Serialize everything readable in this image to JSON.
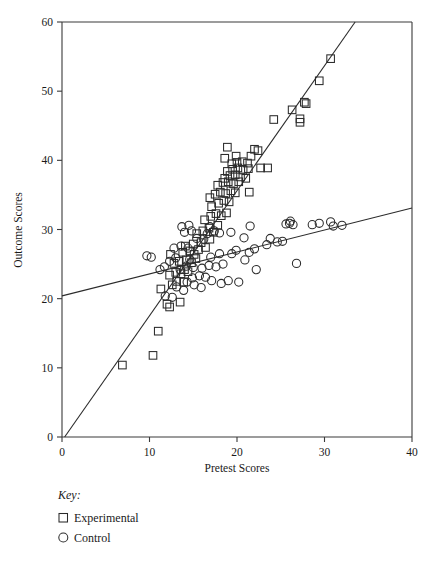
{
  "chart_data": {
    "type": "scatter",
    "title": "",
    "xlabel": "Pretest Scores",
    "ylabel": "Outcome Scores",
    "xlim": [
      0,
      40
    ],
    "ylim": [
      0,
      60
    ],
    "xticks": [
      0,
      10,
      20,
      30,
      40
    ],
    "yticks": [
      0,
      10,
      20,
      30,
      40,
      50,
      60
    ],
    "grid": false,
    "legend_position": "below-axes-left",
    "legend_title": "Key:",
    "series": [
      {
        "name": "Experimental",
        "marker": "square",
        "points": [
          [
            6.9,
            10.4
          ],
          [
            10.4,
            11.8
          ],
          [
            11.0,
            15.3
          ],
          [
            12.3,
            18.8
          ],
          [
            12.0,
            19.2
          ],
          [
            13.5,
            19.5
          ],
          [
            11.3,
            21.4
          ],
          [
            12.6,
            22.0
          ],
          [
            13.1,
            22.5
          ],
          [
            13.9,
            22.4
          ],
          [
            12.3,
            23.4
          ],
          [
            13.0,
            23.8
          ],
          [
            13.6,
            23.6
          ],
          [
            14.0,
            24.2
          ],
          [
            14.4,
            23.9
          ],
          [
            12.8,
            25.1
          ],
          [
            13.4,
            25.4
          ],
          [
            14.2,
            25.6
          ],
          [
            14.8,
            25.2
          ],
          [
            15.3,
            25.8
          ],
          [
            12.4,
            26.4
          ],
          [
            13.8,
            26.7
          ],
          [
            14.6,
            26.9
          ],
          [
            15.1,
            26.4
          ],
          [
            15.6,
            27.1
          ],
          [
            14.1,
            27.6
          ],
          [
            15.0,
            27.9
          ],
          [
            15.9,
            28.1
          ],
          [
            16.4,
            27.4
          ],
          [
            16.9,
            28.6
          ],
          [
            15.4,
            29.4
          ],
          [
            16.1,
            29.8
          ],
          [
            16.8,
            30.2
          ],
          [
            17.3,
            29.6
          ],
          [
            17.8,
            30.6
          ],
          [
            16.3,
            31.4
          ],
          [
            17.0,
            31.9
          ],
          [
            17.6,
            32.3
          ],
          [
            18.2,
            32.0
          ],
          [
            18.8,
            32.4
          ],
          [
            17.1,
            33.3
          ],
          [
            17.9,
            33.8
          ],
          [
            18.5,
            34.2
          ],
          [
            19.1,
            34.0
          ],
          [
            16.9,
            34.6
          ],
          [
            17.5,
            35.1
          ],
          [
            18.1,
            35.4
          ],
          [
            18.7,
            35.2
          ],
          [
            19.3,
            35.6
          ],
          [
            19.8,
            35.3
          ],
          [
            21.4,
            35.4
          ],
          [
            17.8,
            36.4
          ],
          [
            18.4,
            36.8
          ],
          [
            19.0,
            36.9
          ],
          [
            19.6,
            36.6
          ],
          [
            20.2,
            36.9
          ],
          [
            18.6,
            37.4
          ],
          [
            19.2,
            37.8
          ],
          [
            19.8,
            37.9
          ],
          [
            20.4,
            37.6
          ],
          [
            21.0,
            37.4
          ],
          [
            18.9,
            38.4
          ],
          [
            19.5,
            38.7
          ],
          [
            20.1,
            38.9
          ],
          [
            20.7,
            38.6
          ],
          [
            21.3,
            38.8
          ],
          [
            22.7,
            38.9
          ],
          [
            23.5,
            38.9
          ],
          [
            19.4,
            39.5
          ],
          [
            20.0,
            39.7
          ],
          [
            20.6,
            39.8
          ],
          [
            21.2,
            39.6
          ],
          [
            18.6,
            40.3
          ],
          [
            19.9,
            40.6
          ],
          [
            21.6,
            40.6
          ],
          [
            22.4,
            41.4
          ],
          [
            18.9,
            41.9
          ],
          [
            22.0,
            41.6
          ],
          [
            24.2,
            45.9
          ],
          [
            26.3,
            47.3
          ],
          [
            27.2,
            45.5
          ],
          [
            27.2,
            46.0
          ],
          [
            27.7,
            48.4
          ],
          [
            27.9,
            48.2
          ],
          [
            29.4,
            51.5
          ],
          [
            30.7,
            54.7
          ]
        ]
      },
      {
        "name": "Control",
        "marker": "circle",
        "points": [
          [
            11.8,
            20.4
          ],
          [
            12.6,
            20.2
          ],
          [
            13.9,
            21.2
          ],
          [
            13.1,
            21.7
          ],
          [
            14.3,
            22.4
          ],
          [
            15.1,
            22.0
          ],
          [
            15.9,
            21.6
          ],
          [
            14.9,
            23.0
          ],
          [
            15.7,
            23.3
          ],
          [
            16.4,
            23.1
          ],
          [
            17.1,
            22.6
          ],
          [
            18.2,
            22.2
          ],
          [
            19.0,
            22.6
          ],
          [
            20.2,
            22.4
          ],
          [
            11.2,
            24.2
          ],
          [
            11.7,
            24.6
          ],
          [
            13.5,
            24.2
          ],
          [
            14.2,
            24.7
          ],
          [
            15.0,
            24.5
          ],
          [
            16.0,
            24.4
          ],
          [
            16.8,
            24.8
          ],
          [
            17.6,
            24.6
          ],
          [
            18.4,
            25.0
          ],
          [
            20.9,
            25.6
          ],
          [
            22.2,
            24.2
          ],
          [
            26.8,
            25.1
          ],
          [
            9.7,
            26.2
          ],
          [
            10.2,
            26.0
          ],
          [
            12.3,
            25.4
          ],
          [
            13.0,
            25.9
          ],
          [
            14.6,
            25.7
          ],
          [
            17.0,
            26.0
          ],
          [
            18.0,
            26.5
          ],
          [
            19.4,
            26.5
          ],
          [
            21.4,
            26.7
          ],
          [
            12.8,
            27.3
          ],
          [
            13.6,
            27.6
          ],
          [
            14.4,
            27.3
          ],
          [
            19.9,
            27.0
          ],
          [
            22.0,
            27.2
          ],
          [
            23.4,
            27.8
          ],
          [
            24.6,
            28.2
          ],
          [
            15.4,
            28.7
          ],
          [
            16.2,
            28.6
          ],
          [
            20.8,
            28.8
          ],
          [
            23.8,
            28.7
          ],
          [
            25.2,
            28.3
          ],
          [
            14.0,
            29.6
          ],
          [
            14.8,
            29.8
          ],
          [
            16.6,
            29.4
          ],
          [
            17.4,
            29.8
          ],
          [
            18.0,
            29.5
          ],
          [
            19.3,
            29.6
          ],
          [
            13.7,
            30.4
          ],
          [
            14.5,
            30.6
          ],
          [
            16.9,
            30.4
          ],
          [
            21.5,
            30.5
          ],
          [
            25.6,
            30.8
          ],
          [
            26.0,
            30.9
          ],
          [
            26.4,
            30.7
          ],
          [
            26.1,
            31.2
          ],
          [
            28.6,
            30.7
          ],
          [
            29.4,
            30.9
          ],
          [
            30.7,
            31.1
          ],
          [
            31.0,
            30.5
          ],
          [
            32.0,
            30.6
          ]
        ]
      }
    ],
    "fit_lines": [
      {
        "series": "Experimental",
        "x0": 0.3,
        "y0": 0.0,
        "x1": 33.5,
        "y1": 60.0
      },
      {
        "series": "Control",
        "x0": 0.0,
        "y0": 20.4,
        "x1": 40.0,
        "y1": 33.1
      }
    ]
  },
  "axes": {
    "x_title": "Pretest Scores",
    "y_title": "Outcome Scores",
    "x_tick_labels": [
      "0",
      "10",
      "20",
      "30",
      "40"
    ],
    "y_tick_labels": [
      "0",
      "10",
      "20",
      "30",
      "40",
      "50",
      "60"
    ]
  },
  "legend": {
    "title": "Key:",
    "items": [
      {
        "label": "Experimental",
        "marker": "square"
      },
      {
        "label": "Control",
        "marker": "circle"
      }
    ]
  },
  "colors": {
    "ink": "#2b2b2b",
    "axis": "#3a3a3a",
    "background": "#ffffff"
  }
}
